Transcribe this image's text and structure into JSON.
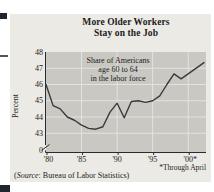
{
  "page": {
    "title_line1": "More Older Workers",
    "title_line2": "Stay on the Job",
    "footnote": "*Through April",
    "source_prefix": "(",
    "source_word": "Source",
    "source_rest": ": Bureau of Labor Statistics)"
  },
  "chart_data": {
    "type": "line",
    "title": "More Older Workers Stay on the Job",
    "annotation": [
      "Share of Americans",
      "age 60 to 64",
      "in the labor force"
    ],
    "ylabel": "Percent",
    "xlabel": "",
    "ylim_shown": [
      43,
      48
    ],
    "y_axis_break": true,
    "y_ticks": [
      {
        "label": "48",
        "value": 48
      },
      {
        "label": "47",
        "value": 47
      },
      {
        "label": "46",
        "value": 46
      },
      {
        "label": "45",
        "value": 45
      },
      {
        "label": "44",
        "value": 44
      },
      {
        "label": "43",
        "value": 43
      },
      {
        "label": "0",
        "value": 0
      }
    ],
    "h_grid_values": [
      47,
      46,
      45,
      44,
      43
    ],
    "x_ticks": [
      {
        "year": 1980,
        "label": "'80"
      },
      {
        "year": 1985,
        "label": "'85"
      },
      {
        "year": 1990,
        "label": "'90"
      },
      {
        "year": 1995,
        "label": "'95"
      },
      {
        "year": 2000,
        "label": "'00*"
      }
    ],
    "footnote": "*Through April",
    "source": "(Source: Bureau of Labor Statistics)",
    "series": [
      {
        "name": "Share of Americans age 60 to 64 in the labor force (percent)",
        "points": [
          [
            1980,
            46.0
          ],
          [
            1981,
            44.7
          ],
          [
            1982,
            44.5
          ],
          [
            1983,
            44.0
          ],
          [
            1984,
            43.8
          ],
          [
            1985,
            43.5
          ],
          [
            1986,
            43.3
          ],
          [
            1987,
            43.25
          ],
          [
            1988,
            43.4
          ],
          [
            1989,
            44.3
          ],
          [
            1990,
            44.85
          ],
          [
            1991,
            43.95
          ],
          [
            1992,
            44.95
          ],
          [
            1993,
            45.0
          ],
          [
            1994,
            44.9
          ],
          [
            1995,
            45.0
          ],
          [
            1996,
            45.3
          ],
          [
            1997,
            46.0
          ],
          [
            1998,
            46.65
          ],
          [
            1999,
            46.35
          ],
          [
            2000,
            47.35
          ]
        ],
        "last_value_note": "2000 value is through April"
      }
    ],
    "layout": {
      "grid": true,
      "v_grid_years": [
        1985,
        1990,
        1995,
        2000
      ],
      "x_tick_dx": [
        2.5,
        0,
        0,
        0,
        2
      ],
      "last_point_to_frame_edge": true,
      "legend": "none"
    }
  },
  "colors": {
    "panel_bg": "#ebeae5",
    "plot_bg": "#c9c8c3",
    "grid": "#e7e6e1",
    "line": "#3a3a3a",
    "axis": "#2b2b2b",
    "text": "#1b1b1b",
    "fragment": "#1e2630"
  }
}
